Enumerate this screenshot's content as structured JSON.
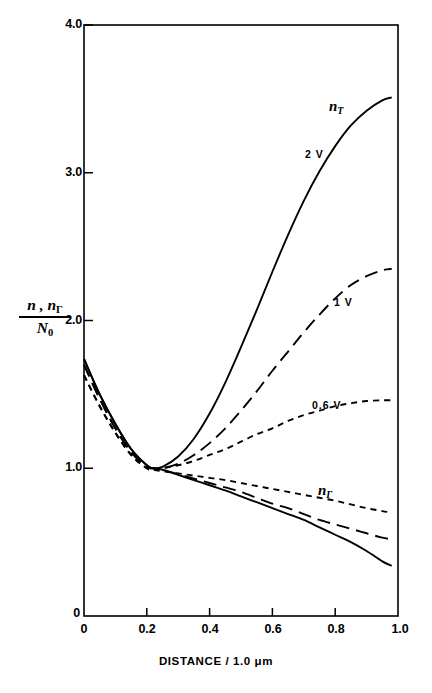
{
  "figure": {
    "background": "#ffffff",
    "ink_color": "#000000"
  },
  "axes": {
    "x_title": "DISTANCE / 1.0 μm",
    "y_title_numerator": "n , n",
    "y_title_numerator_sub": "Γ",
    "y_title_denominator": "N",
    "y_title_denominator_sub": "0",
    "x_ticks": [
      "0",
      "0.2",
      "0.4",
      "0.6",
      "0.8",
      "1.0"
    ],
    "y_ticks": [
      "0",
      "1.0",
      "2.0",
      "3.0",
      "4.0"
    ]
  },
  "annotations": {
    "nT_label": "n",
    "nT_label_sub": "T",
    "nGamma_label": "n",
    "nGamma_label_sub": "Γ",
    "bias_2v": "2 V",
    "bias_1v": "1 V",
    "bias_06v": "0.6 V"
  },
  "chart_data": {
    "type": "line",
    "title": "",
    "xlabel": "DISTANCE / 1.0 μm",
    "ylabel": "n, n_Γ / N_0",
    "xlim": [
      0,
      1.0
    ],
    "ylim": [
      0,
      4.0
    ],
    "xticks": [
      0,
      0.2,
      0.4,
      0.6,
      0.8,
      1.0
    ],
    "yticks": [
      0,
      1.0,
      2.0,
      3.0,
      4.0
    ],
    "grid": false,
    "legend": "inline-annotations",
    "x": [
      0.0,
      0.05,
      0.1,
      0.15,
      0.2,
      0.22,
      0.25,
      0.3,
      0.35,
      0.4,
      0.45,
      0.5,
      0.55,
      0.6,
      0.65,
      0.7,
      0.75,
      0.8,
      0.85,
      0.9,
      0.95,
      0.98
    ],
    "series": [
      {
        "name": "n_T, 2 V",
        "branch": "n_T",
        "bias": "2 V",
        "style": "solid",
        "values": [
          1.74,
          1.5,
          1.3,
          1.13,
          1.02,
          1.0,
          1.01,
          1.08,
          1.2,
          1.37,
          1.58,
          1.82,
          2.07,
          2.33,
          2.58,
          2.81,
          3.01,
          3.18,
          3.32,
          3.42,
          3.49,
          3.51
        ]
      },
      {
        "name": "n_T, 1 V",
        "branch": "n_T",
        "bias": "1 V",
        "style": "long-dash",
        "values": [
          1.7,
          1.47,
          1.27,
          1.11,
          1.01,
          1.0,
          1.0,
          1.03,
          1.09,
          1.17,
          1.27,
          1.39,
          1.52,
          1.66,
          1.79,
          1.92,
          2.04,
          2.15,
          2.24,
          2.3,
          2.34,
          2.35
        ]
      },
      {
        "name": "n_T, 0.6 V",
        "branch": "n_T",
        "bias": "0.6 V",
        "style": "short-dash",
        "values": [
          1.63,
          1.42,
          1.24,
          1.09,
          1.0,
          0.99,
          1.0,
          1.02,
          1.05,
          1.09,
          1.13,
          1.18,
          1.23,
          1.27,
          1.32,
          1.36,
          1.39,
          1.42,
          1.44,
          1.455,
          1.46,
          1.46
        ]
      },
      {
        "name": "n_Γ, 0.6 V",
        "branch": "n_Γ",
        "bias": "0.6 V",
        "style": "short-dash",
        "values": [
          1.63,
          1.42,
          1.24,
          1.09,
          1.0,
          0.99,
          0.98,
          0.965,
          0.95,
          0.935,
          0.92,
          0.9,
          0.88,
          0.86,
          0.84,
          0.82,
          0.8,
          0.78,
          0.755,
          0.73,
          0.71,
          0.7
        ]
      },
      {
        "name": "n_Γ, 1 V",
        "branch": "n_Γ",
        "bias": "1 V",
        "style": "long-dash",
        "values": [
          1.7,
          1.47,
          1.27,
          1.11,
          1.01,
          1.0,
          0.99,
          0.96,
          0.93,
          0.9,
          0.87,
          0.84,
          0.8,
          0.76,
          0.73,
          0.69,
          0.65,
          0.62,
          0.59,
          0.56,
          0.53,
          0.52
        ]
      },
      {
        "name": "n_Γ, 2 V",
        "branch": "n_Γ",
        "bias": "2 V",
        "style": "solid",
        "values": [
          1.74,
          1.5,
          1.3,
          1.13,
          1.02,
          1.0,
          0.99,
          0.955,
          0.92,
          0.885,
          0.85,
          0.81,
          0.77,
          0.73,
          0.69,
          0.65,
          0.6,
          0.55,
          0.5,
          0.44,
          0.37,
          0.34
        ]
      }
    ]
  }
}
